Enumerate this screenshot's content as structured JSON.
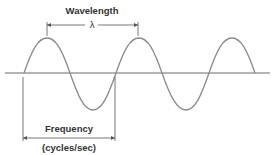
{
  "diagram": {
    "wavelength_label": "Wavelength",
    "lambda_symbol": "λ",
    "frequency_label": "Frequency",
    "frequency_unit": "(cycles/sec)",
    "colors": {
      "wave": "#8a8a8a",
      "axis": "#6a6a6a",
      "text": "#333333",
      "dimension": "#555555"
    }
  }
}
